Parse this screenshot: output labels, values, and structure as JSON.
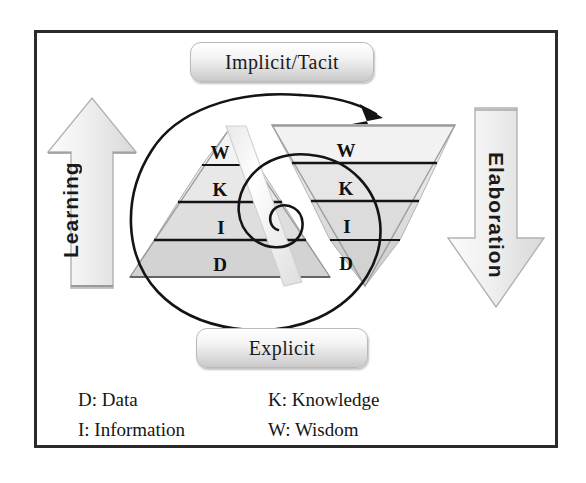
{
  "diagram": {
    "title_top": "Implicit/Tacit",
    "title_bottom": "Explicit",
    "left_arrow_label": "Learning",
    "right_arrow_label": "Elaboration",
    "left_arrow_direction": "up",
    "right_arrow_direction": "down",
    "colors": {
      "frame_border": "#2b2b2b",
      "pyramid_fill_light": "#f1f1f1",
      "pyramid_fill_mid": "#e2e2e2",
      "pyramid_fill_dark": "#d4d4d4",
      "pyramid_stroke": "#1a1a1a",
      "arrow_fill": "#ededed",
      "arrow_stroke": "#b5b5b5",
      "spiral_stroke": "#141414",
      "text": "#151515"
    },
    "left_pyramid": {
      "name": "learning-pyramid",
      "orientation": "apex-up",
      "tiers": [
        "W",
        "K",
        "I",
        "D"
      ]
    },
    "right_pyramid": {
      "name": "elaboration-pyramid",
      "orientation": "apex-down",
      "tiers": [
        "W",
        "K",
        "I",
        "D"
      ]
    },
    "spiral": {
      "name": "knowledge-spiral",
      "turns": 2.5,
      "arrow_at": "top-right",
      "direction": "inward-clockwise"
    },
    "legend": [
      {
        "key": "D",
        "label": "D: Data"
      },
      {
        "key": "K",
        "label": "K: Knowledge"
      },
      {
        "key": "I",
        "label": "I: Information"
      },
      {
        "key": "W",
        "label": "W: Wisdom"
      }
    ]
  }
}
